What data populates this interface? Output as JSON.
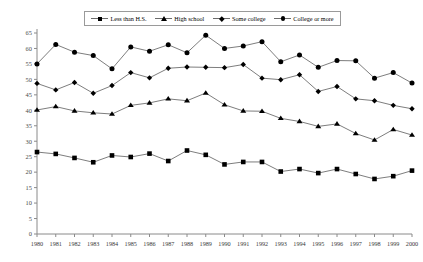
{
  "legend": {
    "position": "top-center",
    "entries": [
      {
        "label": "Less than H.S.",
        "marker": "square-marker"
      },
      {
        "label": "High school",
        "marker": "triangle-marker"
      },
      {
        "label": "Some college",
        "marker": "diamond-marker"
      },
      {
        "label": "College  or more",
        "marker": "circle-marker"
      }
    ]
  },
  "chart_data": {
    "type": "line",
    "title": "",
    "xlabel": "",
    "ylabel": "",
    "grid": false,
    "legend_position": "top-center",
    "x": [
      1980,
      1981,
      1982,
      1983,
      1984,
      1985,
      1986,
      1987,
      1988,
      1989,
      1990,
      1991,
      1992,
      1993,
      1994,
      1995,
      1996,
      1997,
      1998,
      1999,
      2000
    ],
    "xlim": [
      1980,
      2000
    ],
    "ylim": [
      0,
      65
    ],
    "yticks": [
      0,
      5,
      10,
      15,
      20,
      25,
      30,
      35,
      40,
      45,
      50,
      55,
      60,
      65
    ],
    "xtick_labels": [
      "1980",
      "1981",
      "1982",
      "1983",
      "1984",
      "1985",
      "1986",
      "1987",
      "1988",
      "1989",
      "1990",
      "1991",
      "1992",
      "1993",
      "1994",
      "1995",
      "1996",
      "1997",
      "1998",
      "1999",
      "2000"
    ],
    "series": [
      {
        "name": "College  or more",
        "marker": "circle-marker",
        "color": "#000000",
        "values": [
          55.0,
          61.3,
          58.8,
          57.7,
          53.4,
          60.5,
          59.1,
          61.2,
          58.6,
          64.3,
          60.0,
          60.8,
          62.2,
          55.7,
          57.9,
          53.9,
          56.1,
          56.0,
          50.4,
          52.2,
          48.8
        ]
      },
      {
        "name": "Some college",
        "marker": "diamond-marker",
        "color": "#000000",
        "values": [
          48.7,
          46.6,
          49.0,
          45.5,
          48.0,
          52.2,
          50.5,
          53.6,
          54.0,
          53.9,
          53.8,
          54.8,
          50.4,
          49.9,
          51.5,
          46.1,
          47.7,
          43.7,
          43.1,
          41.6,
          40.5
        ]
      },
      {
        "name": "High school",
        "marker": "triangle-marker",
        "color": "#000000",
        "values": [
          40.1,
          41.2,
          39.8,
          39.2,
          38.8,
          41.6,
          42.4,
          43.7,
          43.1,
          45.6,
          41.8,
          39.8,
          39.7,
          37.4,
          36.4,
          34.8,
          35.6,
          32.5,
          30.4,
          33.8,
          32.0
        ]
      },
      {
        "name": "Less than H.S.",
        "marker": "square-marker",
        "color": "#000000",
        "values": [
          26.5,
          25.9,
          24.6,
          23.2,
          25.4,
          24.9,
          26.0,
          23.6,
          27.0,
          25.6,
          22.5,
          23.3,
          23.3,
          20.2,
          21.0,
          19.7,
          21.0,
          19.4,
          17.8,
          18.7,
          20.5
        ]
      }
    ]
  }
}
